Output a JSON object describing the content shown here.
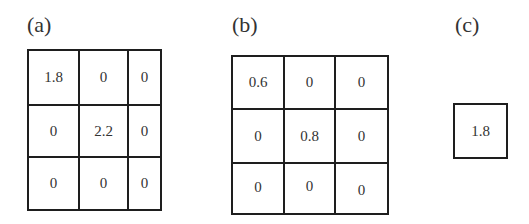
{
  "panels": [
    {
      "label": "(a)",
      "matrix": [
        [
          "1.8",
          "0",
          "0"
        ],
        [
          "0",
          "2.2",
          "0"
        ],
        [
          "0",
          "0",
          "0"
        ]
      ]
    },
    {
      "label": "(b)",
      "matrix": [
        [
          "0.6",
          "0",
          "0"
        ],
        [
          "0",
          "0.8",
          "0"
        ],
        [
          "0",
          "0",
          "0"
        ]
      ]
    },
    {
      "label": "(c)",
      "matrix": [
        [
          "1.8"
        ]
      ]
    }
  ]
}
